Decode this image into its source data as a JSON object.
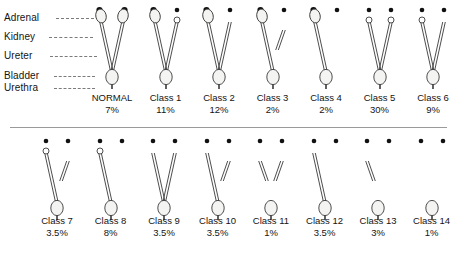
{
  "figure": {
    "divider": true,
    "anatomy_labels": [
      {
        "key": "adrenal",
        "text": "Adrenal"
      },
      {
        "key": "kidney",
        "text": "Kidney"
      },
      {
        "key": "ureter",
        "text": "Ureter"
      },
      {
        "key": "bladder",
        "text": "Bladder"
      },
      {
        "key": "urethra",
        "text": "Urethra"
      }
    ],
    "colors": {
      "ink": "#141414",
      "outline": "#3a3a3a",
      "organ_fill": "#f4f4f2",
      "adrenal_dot": "#111111",
      "leader_line": "#7b7b7b",
      "divider": "#9a9a9a",
      "background": "#ffffff"
    },
    "rows": [
      {
        "row": 1,
        "specimens": [
          {
            "name": "NORMAL",
            "percent": "7%",
            "left": {
              "adrenal": "large",
              "kidney": "full",
              "ureter": "full"
            },
            "right": {
              "adrenal": "large",
              "kidney": "full",
              "ureter": "full"
            },
            "bladder": true,
            "urethra": true
          },
          {
            "name": "Class 1",
            "percent": "11%",
            "left": {
              "adrenal": "large",
              "kidney": "full",
              "ureter": "full"
            },
            "right": {
              "adrenal": "small",
              "kidney": "tiny",
              "ureter": "full"
            },
            "bladder": true,
            "urethra": true
          },
          {
            "name": "Class 2",
            "percent": "12%",
            "left": {
              "adrenal": "large",
              "kidney": "full",
              "ureter": "full"
            },
            "right": {
              "adrenal": "small",
              "kidney": "none",
              "ureter": "full"
            },
            "bladder": true,
            "urethra": true
          },
          {
            "name": "Class 3",
            "percent": "2%",
            "left": {
              "adrenal": "large",
              "kidney": "full",
              "ureter": "full"
            },
            "right": {
              "adrenal": "small",
              "kidney": "none",
              "ureter": "short"
            },
            "bladder": true,
            "urethra": true
          },
          {
            "name": "Class 4",
            "percent": "2%",
            "left": {
              "adrenal": "large",
              "kidney": "full",
              "ureter": "full"
            },
            "right": {
              "adrenal": "small",
              "kidney": "none",
              "ureter": "none"
            },
            "bladder": true,
            "urethra": true
          },
          {
            "name": "Class 5",
            "percent": "30%",
            "left": {
              "adrenal": "small",
              "kidney": "tiny",
              "ureter": "full"
            },
            "right": {
              "adrenal": "small",
              "kidney": "tiny",
              "ureter": "full"
            },
            "bladder": true,
            "urethra": true
          },
          {
            "name": "Class 6",
            "percent": "9%",
            "left": {
              "adrenal": "small",
              "kidney": "tiny",
              "ureter": "full"
            },
            "right": {
              "adrenal": "small",
              "kidney": "none",
              "ureter": "full"
            },
            "bladder": true,
            "urethra": true
          }
        ]
      },
      {
        "row": 2,
        "specimens": [
          {
            "name": "Class 7",
            "percent": "3.5%",
            "left": {
              "adrenal": "small",
              "kidney": "tiny",
              "ureter": "full"
            },
            "right": {
              "adrenal": "small",
              "kidney": "none",
              "ureter": "short"
            },
            "bladder": true,
            "urethra": true
          },
          {
            "name": "Class 8",
            "percent": "8%",
            "left": {
              "adrenal": "small",
              "kidney": "tiny",
              "ureter": "full"
            },
            "right": {
              "adrenal": "small",
              "kidney": "none",
              "ureter": "none"
            },
            "bladder": true,
            "urethra": true
          },
          {
            "name": "Class 9",
            "percent": "3.5%",
            "left": {
              "adrenal": "small",
              "kidney": "none",
              "ureter": "full"
            },
            "right": {
              "adrenal": "small",
              "kidney": "none",
              "ureter": "full"
            },
            "bladder": true,
            "urethra": true
          },
          {
            "name": "Class 10",
            "percent": "3.5%",
            "left": {
              "adrenal": "small",
              "kidney": "none",
              "ureter": "full"
            },
            "right": {
              "adrenal": "small",
              "kidney": "none",
              "ureter": "short"
            },
            "bladder": true,
            "urethra": true
          },
          {
            "name": "Class 11",
            "percent": "1%",
            "left": {
              "adrenal": "small",
              "kidney": "none",
              "ureter": "short"
            },
            "right": {
              "adrenal": "small",
              "kidney": "none",
              "ureter": "short"
            },
            "bladder": true,
            "urethra": true
          },
          {
            "name": "Class 12",
            "percent": "3.5%",
            "left": {
              "adrenal": "small",
              "kidney": "none",
              "ureter": "full"
            },
            "right": {
              "adrenal": "small",
              "kidney": "none",
              "ureter": "none"
            },
            "bladder": true,
            "urethra": true
          },
          {
            "name": "Class 13",
            "percent": "3%",
            "left": {
              "adrenal": "small",
              "kidney": "none",
              "ureter": "short"
            },
            "right": {
              "adrenal": "small",
              "kidney": "none",
              "ureter": "none"
            },
            "bladder": true,
            "urethra": true
          },
          {
            "name": "Class 14",
            "percent": "1%",
            "left": {
              "adrenal": "small",
              "kidney": "none",
              "ureter": "none"
            },
            "right": {
              "adrenal": "small",
              "kidney": "none",
              "ureter": "none"
            },
            "bladder": true,
            "urethra": true
          }
        ]
      }
    ]
  }
}
